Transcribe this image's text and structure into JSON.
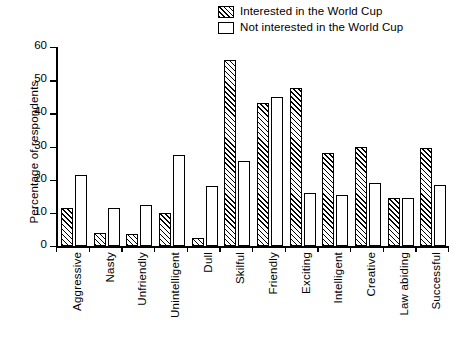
{
  "chart_data": {
    "type": "bar",
    "title": "",
    "subtitle": "",
    "xlabel": "",
    "ylabel": "Percentage of respondents",
    "ylim": [
      0,
      60
    ],
    "yticks": [
      0,
      10,
      20,
      30,
      40,
      50,
      60
    ],
    "grid": false,
    "legend_position": "top-right",
    "categories": [
      "Aggressive",
      "Nasty",
      "Unfriendly",
      "Unintelligent",
      "Dull",
      "Skilful",
      "Friendly",
      "Exciting",
      "Intelligent",
      "Creative",
      "Law abiding",
      "Successful"
    ],
    "series": [
      {
        "name": "Interested in the World Cup",
        "fill": "hatched",
        "values": [
          11.5,
          4,
          3.5,
          10,
          2.5,
          56,
          43,
          47.5,
          28,
          30,
          14.5,
          29.5
        ]
      },
      {
        "name": "Not interested in the World Cup",
        "fill": "white",
        "values": [
          21.5,
          11.5,
          12.5,
          27.5,
          18,
          25.5,
          45,
          16,
          15.5,
          19,
          14.5,
          18.5
        ]
      }
    ]
  },
  "legend": {
    "items": [
      {
        "label": "Interested in the World Cup",
        "swatch": "hatched"
      },
      {
        "label": "Not interested in the World Cup",
        "swatch": "white"
      }
    ]
  },
  "colors": {
    "ink": "#000000",
    "background": "#ffffff"
  }
}
